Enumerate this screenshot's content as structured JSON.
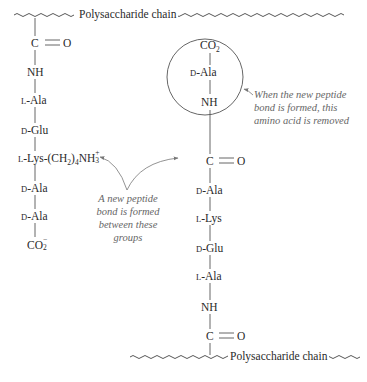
{
  "diagram": {
    "top_chain": {
      "label": "Polysaccharide chain"
    },
    "bottom_chain": {
      "label": "Polysaccharide chain"
    },
    "left_strand": {
      "carbonyl": {
        "c": "C",
        "bond": "=",
        "o": "O"
      },
      "nh": "NH",
      "residues": [
        {
          "prefix": "L",
          "name": "-Ala"
        },
        {
          "prefix": "D",
          "name": "-Glu"
        },
        {
          "prefix": "L",
          "name": "-Lys-(CH",
          "sub1": "2",
          "mid": ")",
          "sub2": "4",
          "tail": "NH",
          "sup": "+",
          "sub3": "3"
        },
        {
          "prefix": "D",
          "name": "-Ala"
        },
        {
          "prefix": "D",
          "name": "-Ala"
        }
      ],
      "terminal": {
        "text": "CO",
        "sub": "2",
        "sup": "−"
      }
    },
    "right_strand": {
      "circled_group": {
        "terminal": {
          "text": "CO",
          "sub": "2"
        },
        "residue": {
          "prefix": "D",
          "name": "-Ala"
        },
        "nh": "NH"
      },
      "carbonyl_top": {
        "c": "C",
        "o": "O"
      },
      "residues": [
        {
          "prefix": "D",
          "name": "-Ala"
        },
        {
          "prefix": "L",
          "name": "-Lys"
        },
        {
          "prefix": "D",
          "name": "-Glu"
        },
        {
          "prefix": "L",
          "name": "-Ala"
        }
      ],
      "nh": "NH",
      "carbonyl_bottom": {
        "c": "C",
        "o": "O"
      }
    },
    "annotations": {
      "removed_note": [
        "When the new peptide",
        "bond is formed, this",
        "amino acid is removed"
      ],
      "bond_note": [
        "A new peptide",
        "bond is formed",
        "between these",
        "groups"
      ]
    },
    "colors": {
      "ink": "#2a2a2a",
      "annotation": "#666666",
      "lines": "#555555"
    }
  }
}
